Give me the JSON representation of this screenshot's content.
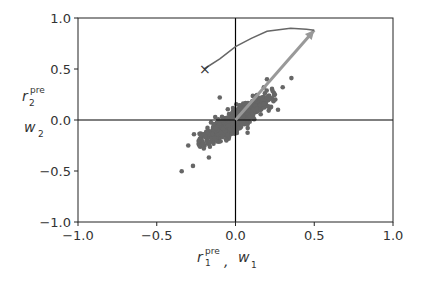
{
  "chart_data": {
    "type": "scatter",
    "title": "",
    "xlabel": "r_1^pre , w_1",
    "ylabel": "r_2^pre  w_2",
    "xlim": [
      -1.0,
      1.0
    ],
    "ylim": [
      -1.0,
      1.0
    ],
    "xticks": [
      "−1.0",
      "−0.5",
      "0.0",
      "0.5",
      "1.0"
    ],
    "yticks": [
      "−1.0",
      "−0.5",
      "0.0",
      "0.5",
      "1.0"
    ],
    "grid": false,
    "axis_lines_at_zero": true,
    "series": [
      {
        "name": "r_pre samples",
        "kind": "scatter",
        "color": "#666666",
        "description": "dense elongated cloud along the diagonal, roughly from (-0.3,-0.4) to (0.3,0.35)",
        "center": [
          0.0,
          0.0
        ],
        "principal_direction": [
          0.6,
          0.8
        ]
      },
      {
        "name": "principal eigenvector arrow",
        "kind": "arrow",
        "color": "#999999",
        "from": [
          0.0,
          0.0
        ],
        "to": [
          0.5,
          0.88
        ]
      },
      {
        "name": "weight trajectory",
        "kind": "line",
        "color": "#666666",
        "points": [
          [
            -0.2,
            0.5
          ],
          [
            -0.1,
            0.6
          ],
          [
            0.0,
            0.72
          ],
          [
            0.1,
            0.8
          ],
          [
            0.2,
            0.87
          ],
          [
            0.35,
            0.9
          ],
          [
            0.45,
            0.89
          ],
          [
            0.5,
            0.88
          ]
        ],
        "start_marker": "x"
      }
    ],
    "annotations": [
      {
        "text": "X",
        "x": -0.2,
        "y": 0.5,
        "meaning": "trajectory start"
      }
    ]
  },
  "labels": {
    "x_main": "r",
    "x_sup": "pre",
    "x_sub": "1",
    "x_sep": ",",
    "x_w": "w",
    "x_w_sub": "1",
    "y_main": "r",
    "y_sup": "pre",
    "y_sub": "2",
    "y_w": "w",
    "y_w_sub": "2",
    "start_marker": "×"
  }
}
